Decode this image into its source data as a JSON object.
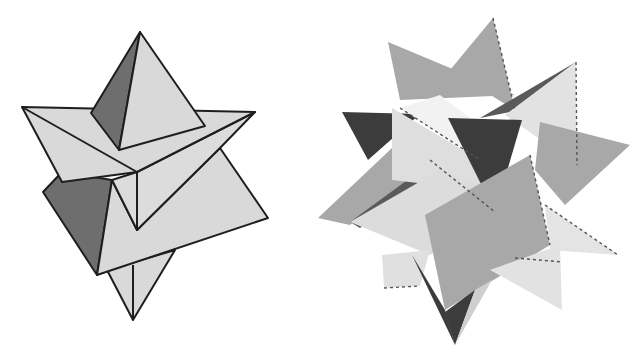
{
  "figures": [
    {
      "id": "stella-octangula",
      "description": "Compound of two tetrahedra (stella octangula)",
      "colors": {
        "light_face": "#d9d9d9",
        "dark_face": "#6e6e6e",
        "edge": "#1e1e1e"
      }
    },
    {
      "id": "compound-of-five-tetrahedra",
      "description": "Compound of five tetrahedra",
      "colors": {
        "lightest": "#f0f0f0",
        "light": "#d4d4d4",
        "mid": "#a8a8a8",
        "dark": "#5a5a5a",
        "darkest": "#3c3c3c"
      }
    }
  ]
}
